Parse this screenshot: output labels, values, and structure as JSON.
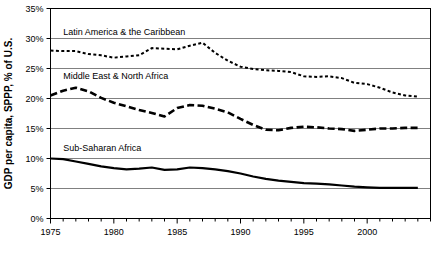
{
  "chart_data": {
    "type": "line",
    "title": "",
    "xlabel": "",
    "ylabel": "GDP per capita, SPPP, % of U.S.",
    "xlim": [
      1975,
      2005
    ],
    "ylim": [
      0,
      35
    ],
    "ytick_labels": [
      "0%",
      "5%",
      "10%",
      "15%",
      "20%",
      "25%",
      "30%",
      "35%"
    ],
    "ytick_values": [
      0,
      5,
      10,
      15,
      20,
      25,
      30,
      35
    ],
    "xtick_labels": [
      "1975",
      "1980",
      "1985",
      "1990",
      "1995",
      "2000"
    ],
    "xtick_values": [
      1975,
      1980,
      1985,
      1990,
      1995,
      2000
    ],
    "xtick_minor_values": [
      1975,
      1976,
      1977,
      1978,
      1979,
      1980,
      1981,
      1982,
      1983,
      1984,
      1985,
      1986,
      1987,
      1988,
      1989,
      1990,
      1991,
      1992,
      1993,
      1994,
      1995,
      1996,
      1997,
      1998,
      1999,
      2000,
      2001,
      2002,
      2003,
      2004,
      2005
    ],
    "grid": "horizontal",
    "legend_position": "inline-annotations",
    "x": [
      1975,
      1976,
      1977,
      1978,
      1979,
      1980,
      1981,
      1982,
      1983,
      1984,
      1985,
      1986,
      1987,
      1988,
      1989,
      1990,
      1991,
      1992,
      1993,
      1994,
      1995,
      1996,
      1997,
      1998,
      1999,
      2000,
      2001,
      2002,
      2003,
      2004
    ],
    "series": [
      {
        "name": "Latin America & the Caribbean",
        "style": "dotted",
        "color": "#000000",
        "label_x": 1976,
        "label_y": 30.6,
        "values": [
          28.0,
          27.9,
          27.9,
          27.4,
          27.2,
          26.8,
          27.0,
          27.2,
          28.4,
          28.3,
          28.2,
          28.8,
          29.3,
          27.6,
          26.3,
          25.3,
          24.9,
          24.7,
          24.6,
          24.4,
          23.7,
          23.6,
          23.7,
          23.4,
          22.6,
          22.4,
          21.8,
          21.0,
          20.5,
          20.3
        ]
      },
      {
        "name": "Middle East & North Africa",
        "style": "dashed",
        "color": "#000000",
        "label_x": 1976,
        "label_y": 23.2,
        "values": [
          20.5,
          21.3,
          21.8,
          21.2,
          20.1,
          19.3,
          18.7,
          18.1,
          17.6,
          17.0,
          18.4,
          18.9,
          18.8,
          18.3,
          17.7,
          16.6,
          15.6,
          14.8,
          14.7,
          15.1,
          15.3,
          15.2,
          15.0,
          14.9,
          14.6,
          14.8,
          15.0,
          15.0,
          15.1,
          15.1
        ]
      },
      {
        "name": "Sub-Saharan Africa",
        "style": "solid",
        "color": "#000000",
        "label_x": 1976,
        "label_y": 11.2,
        "values": [
          10.0,
          9.9,
          9.5,
          9.1,
          8.7,
          8.4,
          8.2,
          8.3,
          8.5,
          8.1,
          8.2,
          8.5,
          8.4,
          8.2,
          7.9,
          7.5,
          7.0,
          6.6,
          6.3,
          6.1,
          5.9,
          5.8,
          5.7,
          5.5,
          5.3,
          5.2,
          5.1,
          5.1,
          5.1,
          5.1
        ]
      }
    ]
  }
}
